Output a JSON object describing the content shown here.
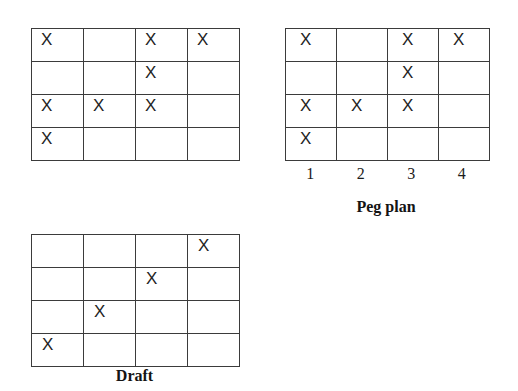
{
  "page": {
    "background_color": "#ffffff",
    "line_color": "#3b3b3b",
    "text_color": "#1a1a1a",
    "mark_symbol": "X"
  },
  "grids": {
    "top_left": {
      "name": "unlabeled-grid",
      "rows": 4,
      "columns": 4,
      "cells": [
        [
          "X",
          "",
          "X",
          "X"
        ],
        [
          "",
          "",
          "X",
          ""
        ],
        [
          "X",
          "X",
          "X",
          ""
        ],
        [
          "X",
          "",
          "",
          ""
        ]
      ]
    },
    "peg_plan": {
      "name": "peg-plan-grid",
      "caption": "Peg plan",
      "rows": 4,
      "columns": 4,
      "column_labels": [
        "1",
        "2",
        "3",
        "4"
      ],
      "cells": [
        [
          "X",
          "",
          "X",
          "X"
        ],
        [
          "",
          "",
          "X",
          ""
        ],
        [
          "X",
          "X",
          "X",
          ""
        ],
        [
          "X",
          "",
          "",
          ""
        ]
      ]
    },
    "draft": {
      "name": "draft-grid",
      "caption": "Draft",
      "rows": 4,
      "columns": 4,
      "cells": [
        [
          "",
          "",
          "",
          "X"
        ],
        [
          "",
          "",
          "X",
          ""
        ],
        [
          "",
          "X",
          "",
          ""
        ],
        [
          "X",
          "",
          "",
          ""
        ]
      ]
    }
  }
}
